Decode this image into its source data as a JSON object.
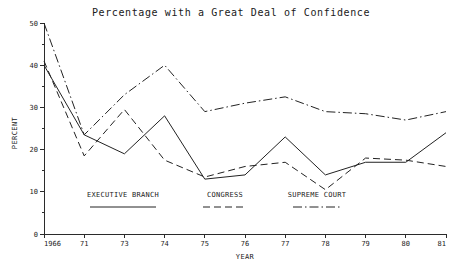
{
  "chart_data": {
    "type": "line",
    "title": "Percentage with a Great Deal of Confidence",
    "xlabel": "YEAR",
    "ylabel": "PERCENT",
    "grid": false,
    "legend_position": "inside-bottom",
    "xlim": [
      0,
      10
    ],
    "ylim": [
      0,
      50
    ],
    "yticks": [
      0,
      10,
      20,
      30,
      40,
      50
    ],
    "ytick_labels": [
      "0",
      "10",
      "20",
      "30",
      "40",
      "50"
    ],
    "yminor_ticks": [
      5,
      15,
      25,
      35,
      45
    ],
    "categories": [
      "1966",
      "71",
      "73",
      "74",
      "75",
      "76",
      "77",
      "78",
      "79",
      "80",
      "81"
    ],
    "x": [
      1966,
      1971,
      1973,
      1974,
      1975,
      1976,
      1977,
      1978,
      1979,
      1980,
      1981
    ],
    "series": [
      {
        "name": "EXECUTIVE BRANCH",
        "style": "solid",
        "values": [
          40,
          23.5,
          19,
          28,
          13,
          14,
          23,
          14,
          17,
          17,
          24
        ]
      },
      {
        "name": "CONGRESS",
        "style": "dashed",
        "values": [
          41,
          18.5,
          29.5,
          17.5,
          13.5,
          16,
          17,
          10.5,
          18,
          17.5,
          16
        ]
      },
      {
        "name": "SUPREME COURT",
        "style": "dash-dot",
        "values": [
          50,
          23.5,
          33,
          40,
          29,
          31,
          32.5,
          29,
          28.5,
          27,
          29
        ]
      }
    ]
  },
  "legend": {
    "entries": [
      {
        "label": "EXECUTIVE BRANCH",
        "style": "solid"
      },
      {
        "label": "CONGRESS",
        "style": "dashed"
      },
      {
        "label": "SUPREME COURT",
        "style": "dash-dot"
      }
    ]
  },
  "colors": {
    "ink": "#222222",
    "background": "#ffffff"
  }
}
